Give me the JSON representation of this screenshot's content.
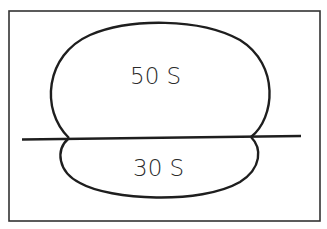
{
  "diagram": {
    "large_subunit": {
      "label": "50 S"
    },
    "small_subunit": {
      "label": "30 S"
    },
    "colors": {
      "stroke": "#1e1e1e",
      "frame": "#333333",
      "background": "#ffffff"
    }
  }
}
